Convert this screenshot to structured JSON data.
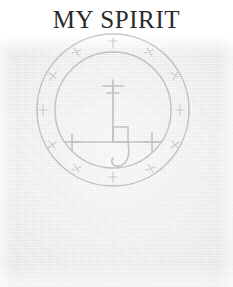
{
  "page": {
    "title": "MY SPIRIT",
    "background_color": "#ffffff",
    "scan_background_color": "#f1f1f1",
    "ink_color": "#9a9a9a",
    "title_color": "#2b2b2b"
  },
  "sigil": {
    "name": "spirit-sigil",
    "description": "Faint hand-drawn occult seal: two concentric circles enclosing a ring band of small glyph marks, with a central cross-staff figure",
    "center_x": 113,
    "center_y": 148,
    "outer_radius": 76,
    "inner_radius": 58,
    "ink_opacity": 0.55,
    "elements": [
      {
        "name": "outer-circle",
        "type": "circle",
        "radius": 76
      },
      {
        "name": "inner-circle",
        "type": "circle",
        "radius": 58
      },
      {
        "name": "ring-band-glyphs",
        "type": "glyph-ring",
        "count": 12
      },
      {
        "name": "patriarchal-cross-top",
        "type": "double-bar-cross"
      },
      {
        "name": "vertical-stem",
        "type": "line"
      },
      {
        "name": "horizontal-bar",
        "type": "line"
      },
      {
        "name": "left-terminal-cross",
        "type": "small-cross"
      },
      {
        "name": "right-terminal-cross",
        "type": "small-cross"
      },
      {
        "name": "center-square",
        "type": "square"
      },
      {
        "name": "descending-hook",
        "type": "curve"
      }
    ]
  }
}
